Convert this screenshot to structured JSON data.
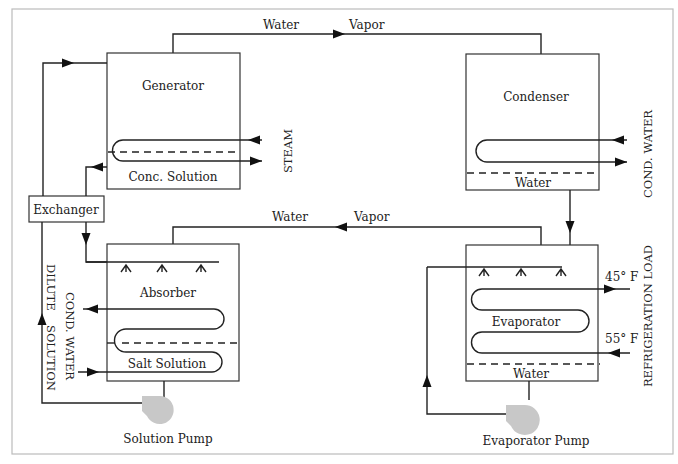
{
  "diagram": {
    "components": {
      "generator": {
        "label": "Generator",
        "sublabel": "Conc. Solution"
      },
      "condenser": {
        "label": "Condenser",
        "sublabel": "Water"
      },
      "absorber": {
        "label": "Absorber",
        "sublabel": "Salt Solution"
      },
      "evaporator": {
        "label": "Evaporator",
        "sublabel": "Water"
      },
      "exchanger": {
        "label": "Exchanger"
      },
      "solution_pump": {
        "label": "Solution Pump"
      },
      "evaporator_pump": {
        "label": "Evaporator Pump"
      }
    },
    "flows": {
      "top_water": "Water",
      "top_vapor": "Vapor",
      "mid_water": "Water",
      "mid_vapor": "Vapor",
      "steam": "STEAM",
      "condenser_cooling": "COND. WATER",
      "absorber_cooling": "COND. WATER",
      "dilute_line1": "DILUTE",
      "dilute_line2": "SOLUTION",
      "refrigeration_load": "REFRIGERATION LOAD",
      "supply_temp": "45° F",
      "return_temp": "55° F"
    },
    "colors": {
      "line": "#222222",
      "box_border": "#333333",
      "pump_fill": "#c8c8c8",
      "frame": "#bbbbbb"
    }
  }
}
